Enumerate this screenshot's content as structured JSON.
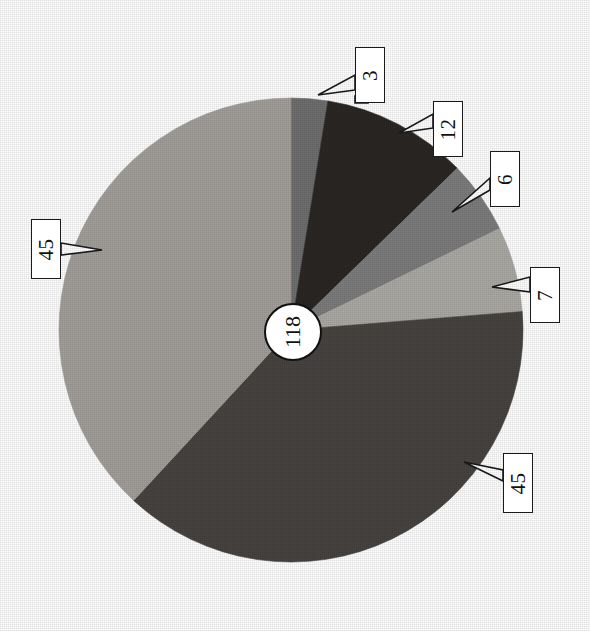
{
  "chart_data": {
    "type": "pie",
    "title": "",
    "subtitle": "",
    "xlabel": "",
    "ylabel": "",
    "legend_position": "none",
    "grid": false,
    "center_label": "118",
    "total": 118,
    "start_angle_deg": 0,
    "direction": "clockwise",
    "categories": [
      "3",
      "12",
      "6",
      "7",
      "45",
      "45"
    ],
    "values": [
      3,
      12,
      6,
      7,
      45,
      45
    ],
    "labels": [
      "3",
      "12",
      "6",
      "7",
      "45",
      "45"
    ],
    "colors": [
      "#6f6f6f",
      "#2a2724",
      "#7d7d7d",
      "#adaaa5",
      "#474440",
      "#a3a09b"
    ],
    "slices": [
      {
        "label": "3",
        "value": 3,
        "color": "#6f6f6f",
        "start_deg": 0,
        "end_deg": 9.153
      },
      {
        "label": "12",
        "value": 12,
        "color": "#2a2724",
        "start_deg": 9.153,
        "end_deg": 45.763
      },
      {
        "label": "6",
        "value": 6,
        "color": "#7d7d7d",
        "start_deg": 45.763,
        "end_deg": 64.068
      },
      {
        "label": "7",
        "value": 7,
        "color": "#adaaa5",
        "start_deg": 64.068,
        "end_deg": 85.424
      },
      {
        "label": "45",
        "value": 45,
        "color": "#474440",
        "start_deg": 85.424,
        "end_deg": 222.712
      },
      {
        "label": "45",
        "value": 45,
        "color": "#a3a09b",
        "start_deg": 222.712,
        "end_deg": 360
      }
    ]
  },
  "geometry": {
    "cx": 291,
    "cy": 330,
    "r": 232,
    "hub_r": 27
  },
  "callouts": [
    {
      "name": "callout-3",
      "text": "3",
      "box_x": 355,
      "box_y": 47,
      "box_w": 30,
      "box_h": 56,
      "tail": "M355,90 L318,95 L355,75 Z",
      "notch": "M355,96 L355,103 L368,103 L368,96 Z"
    },
    {
      "name": "callout-12",
      "text": "12",
      "box_x": 433,
      "box_y": 101,
      "box_w": 30,
      "box_h": 56,
      "tail": "M433,128 L399,133 L433,114 Z",
      "notch": ""
    },
    {
      "name": "callout-6",
      "text": "6",
      "box_x": 490,
      "box_y": 151,
      "box_w": 30,
      "box_h": 56,
      "tail": "M490,190 L452,212 L490,178 Z",
      "notch": ""
    },
    {
      "name": "callout-7",
      "text": "7",
      "box_x": 530,
      "box_y": 267,
      "box_w": 30,
      "box_h": 56,
      "tail": "M530,292 L492,287 L530,277 Z",
      "notch": ""
    },
    {
      "name": "callout-45-lowerright",
      "text": "45",
      "box_x": 503,
      "box_y": 453,
      "box_w": 30,
      "box_h": 60,
      "tail": "M503,481 L464,462 L503,470 Z",
      "notch": ""
    },
    {
      "name": "callout-45-left",
      "text": "45",
      "box_x": 31,
      "box_y": 219,
      "box_w": 30,
      "box_h": 60,
      "tail": "M61,243 L102,250 L61,255 Z",
      "notch": ""
    }
  ],
  "palette": {
    "background": "#ffffff",
    "outline": "#1a1a1a",
    "text": "#111111"
  }
}
